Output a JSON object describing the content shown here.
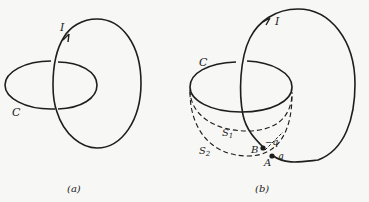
{
  "panel_a": {
    "caption": "(a)",
    "current_label": "I",
    "loop_label": "C"
  },
  "panel_b": {
    "caption": "(b)",
    "current_label": "I",
    "loop_label": "C",
    "surface1_label": "S",
    "surface1_sub": "1",
    "surface2_label": "S",
    "surface2_sub": "2",
    "point_b_label": "B",
    "point_a_label": "A",
    "charge_neg_label": "−q",
    "charge_pos_label": "q"
  },
  "colors": {
    "stroke": "#1e1e1e",
    "background": "#f7f7f5"
  }
}
